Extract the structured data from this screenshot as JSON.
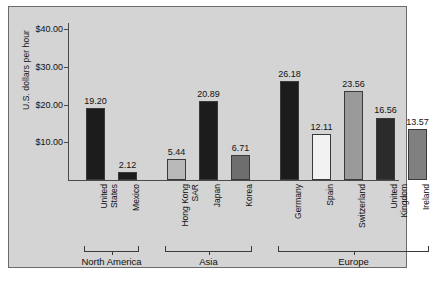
{
  "chart_data": {
    "type": "bar",
    "title": "",
    "xlabel": "",
    "ylabel": "U.S. dollars per hour",
    "ylim": [
      0,
      40
    ],
    "grid": false,
    "legend": "none",
    "ytick_labels": [
      "$10.00",
      "$20.00",
      "$30.00",
      "$40.00"
    ],
    "ytick_values": [
      10,
      20,
      30,
      40
    ],
    "categories": [
      "United States",
      "Mexico",
      "Hong Kong SAR",
      "Japan",
      "Korea",
      "Germany",
      "Spain",
      "Switzerland",
      "United Kingdom",
      "Ireland"
    ],
    "values": [
      19.2,
      2.12,
      5.44,
      20.89,
      6.71,
      26.18,
      12.11,
      23.56,
      16.56,
      13.57
    ],
    "value_labels": [
      "19.20",
      "2.12",
      "5.44",
      "20.89",
      "6.71",
      "26.18",
      "12.11",
      "23.56",
      "16.56",
      "13.57"
    ],
    "bar_colors": [
      "#1c1c1c",
      "#1c1c1c",
      "#b9b9b9",
      "#1c1c1c",
      "#6e6e6e",
      "#1c1c1c",
      "#f2f2f2",
      "#9a9a9a",
      "#2b2b2b",
      "#808080"
    ],
    "groups": [
      {
        "label": "North America",
        "members": [
          "United States",
          "Mexico"
        ]
      },
      {
        "label": "Asia",
        "members": [
          "Hong Kong SAR",
          "Japan",
          "Korea"
        ]
      },
      {
        "label": "Europe",
        "members": [
          "Germany",
          "Spain",
          "Switzerland",
          "United Kingdom",
          "Ireland"
        ]
      }
    ],
    "background_color": "#d4d4d4",
    "axis_color": "#4a4a4a"
  }
}
